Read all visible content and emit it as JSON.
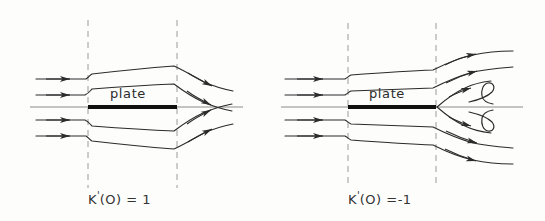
{
  "figure": {
    "background_color": "#fdfdfc",
    "ink_color": "#2b2b2b",
    "axis_color": "#8a8a8a",
    "dashed_color": "#9a9a9a",
    "plate_color": "#111111",
    "width": 545,
    "height": 221
  },
  "panels": [
    {
      "id": "left",
      "caption": "K'(O) = 1",
      "caption_base": "K",
      "caption_rest": "(O) = 1",
      "plate_label": "plate",
      "flow_description": "attached flow, streamlines converge toward centerline downstream of trailing edge",
      "dashed_lines": [
        {
          "name": "leading-edge-station",
          "x": 88
        },
        {
          "name": "trailing-edge-station",
          "x": 177
        }
      ],
      "plate": {
        "x_start": 88,
        "x_end": 177,
        "y": 107
      },
      "inlet_arrow_count": 4,
      "outlet_arrow_count": 4
    },
    {
      "id": "right",
      "caption": "K'(O) =-1",
      "caption_base": "K",
      "caption_rest": "(O) =-1",
      "plate_label": "plate",
      "flow_description": "separated flow, streamlines diverge and two recirculating hook vortices form behind the plate",
      "dashed_lines": [
        {
          "name": "leading-edge-station",
          "x": 75
        },
        {
          "name": "trailing-edge-station",
          "x": 163
        }
      ],
      "plate": {
        "x_start": 75,
        "x_end": 163,
        "y": 107
      },
      "inlet_arrow_count": 4,
      "outlet_arrow_count": 4,
      "recirculation_curls": 2
    }
  ]
}
